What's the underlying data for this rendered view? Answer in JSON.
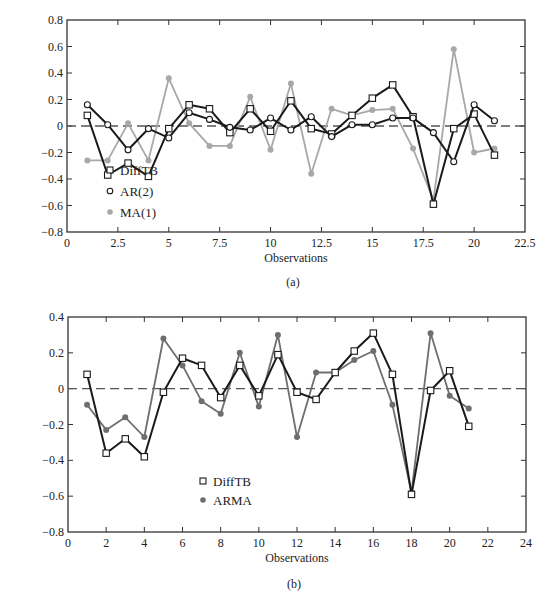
{
  "chart_data": [
    {
      "id": "a",
      "type": "line",
      "caption": "(a)",
      "title": "",
      "xlabel": "Observations",
      "ylabel": "",
      "xlim": [
        0,
        22.5
      ],
      "ylim": [
        -0.8,
        0.8
      ],
      "x_ticks": [
        "0",
        "2.5",
        "5",
        "7.5",
        "10",
        "12.5",
        "15",
        "17.5",
        "20",
        "22.5"
      ],
      "y_ticks": [
        "0.8",
        "0.6",
        "0.4",
        "0.2",
        "0",
        "-0.2",
        "-0.4",
        "-0.6",
        "-0.8"
      ],
      "grid": false,
      "zero_line": "dashed",
      "legend_position": "lower-left-inside",
      "x": [
        1,
        2,
        3,
        4,
        5,
        6,
        7,
        8,
        9,
        10,
        11,
        12,
        13,
        14,
        15,
        16,
        17,
        18,
        19,
        20,
        21
      ],
      "series": [
        {
          "name": "DiffTB",
          "marker": "square-open",
          "color": "#1a1a1a",
          "values": [
            0.08,
            -0.37,
            -0.28,
            -0.38,
            -0.02,
            0.16,
            0.13,
            -0.05,
            0.13,
            -0.04,
            0.19,
            -0.02,
            -0.06,
            0.08,
            0.21,
            0.31,
            0.07,
            -0.59,
            -0.02,
            0.09,
            -0.22
          ]
        },
        {
          "name": "AR(2)",
          "marker": "circle-open",
          "color": "#1a1a1a",
          "values": [
            0.16,
            0.01,
            -0.18,
            -0.02,
            -0.09,
            0.1,
            0.05,
            -0.01,
            -0.03,
            0.06,
            -0.03,
            0.07,
            -0.08,
            0.01,
            0.01,
            0.06,
            0.06,
            -0.05,
            -0.27,
            0.16,
            0.04
          ]
        },
        {
          "name": "MA(1)",
          "marker": "circle-filled",
          "color": "#a8a8a8",
          "values": [
            -0.26,
            -0.26,
            0.02,
            -0.26,
            0.36,
            0.02,
            -0.15,
            -0.15,
            0.22,
            -0.18,
            0.32,
            -0.36,
            0.13,
            0.08,
            0.12,
            0.13,
            -0.17,
            -0.56,
            0.58,
            -0.2,
            -0.17
          ]
        }
      ]
    },
    {
      "id": "b",
      "type": "line",
      "caption": "(b)",
      "title": "",
      "xlabel": "Observations",
      "ylabel": "",
      "xlim": [
        0,
        24
      ],
      "ylim": [
        -0.8,
        0.4
      ],
      "x_ticks": [
        "0",
        "2",
        "4",
        "6",
        "8",
        "10",
        "12",
        "14",
        "16",
        "18",
        "20",
        "22",
        "24"
      ],
      "y_ticks": [
        "0.4",
        "0.2",
        "0",
        "-0.2",
        "-0.4",
        "-0.6",
        "-0.8"
      ],
      "grid": false,
      "zero_line": "dashed",
      "legend_position": "lower-left-inside",
      "x": [
        1,
        2,
        3,
        4,
        5,
        6,
        7,
        8,
        9,
        10,
        11,
        12,
        13,
        14,
        15,
        16,
        17,
        18,
        19,
        20,
        21
      ],
      "series": [
        {
          "name": "DiffTB",
          "marker": "square-open",
          "color": "#1a1a1a",
          "values": [
            0.08,
            -0.36,
            -0.28,
            -0.38,
            -0.02,
            0.17,
            0.13,
            -0.05,
            0.13,
            -0.04,
            0.19,
            -0.02,
            -0.06,
            0.09,
            0.21,
            0.31,
            0.08,
            -0.59,
            -0.01,
            0.1,
            -0.21
          ]
        },
        {
          "name": "ARMA",
          "marker": "circle-filled",
          "color": "#6e6e6e",
          "values": [
            -0.09,
            -0.23,
            -0.16,
            -0.27,
            0.28,
            0.13,
            -0.07,
            -0.14,
            0.2,
            -0.1,
            0.3,
            -0.27,
            0.09,
            0.09,
            0.16,
            0.21,
            -0.09,
            -0.58,
            0.31,
            -0.04,
            -0.11
          ]
        }
      ]
    }
  ]
}
